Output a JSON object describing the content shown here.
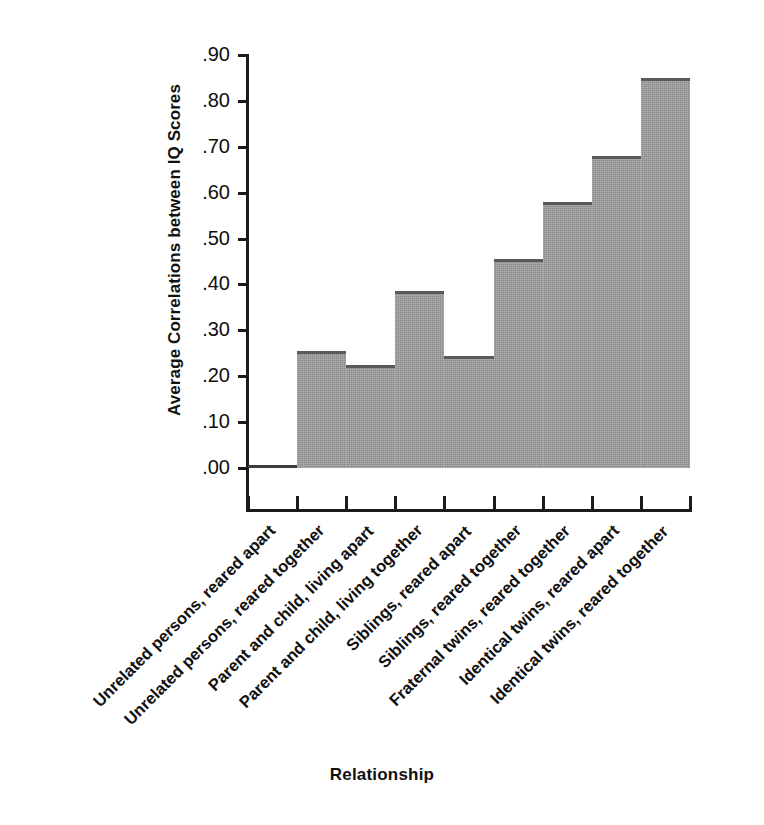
{
  "chart_data": {
    "type": "bar",
    "title": "",
    "xlabel": "Relationship",
    "ylabel": "Average Correlations between IQ Scores",
    "ylim": [
      0.0,
      0.9
    ],
    "yticks": [
      ".00",
      ".10",
      ".20",
      ".30",
      ".40",
      ".50",
      ".60",
      ".70",
      ".80",
      ".90"
    ],
    "ytick_values": [
      0.0,
      0.1,
      0.2,
      0.3,
      0.4,
      0.5,
      0.6,
      0.7,
      0.8,
      0.9
    ],
    "grid": false,
    "legend": null,
    "bar_color": "#9a9a9a",
    "bar_edge_color": "#5a5a5a",
    "categories": [
      "Unrelated persons, reared apart",
      "Unrelated persons, reared together",
      "Parent and child, living apart",
      "Parent and child, living together",
      "Siblings, reared apart",
      "Siblings, reared together",
      "Fraternal twins, reared together",
      "Identical twins, reared apart",
      "Identical twins, reared together"
    ],
    "values": [
      0.0,
      0.255,
      0.225,
      0.385,
      0.245,
      0.455,
      0.58,
      0.68,
      0.85
    ]
  }
}
